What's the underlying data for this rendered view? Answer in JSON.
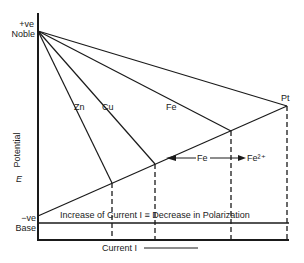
{
  "diagram": {
    "type": "evans-polarization-diagram",
    "y_axis": {
      "label": "Potential",
      "symbol": "E",
      "top_sign": "+ve",
      "top_label": "Noble",
      "bottom_sign": "−ve",
      "bottom_label": "Base"
    },
    "x_axis": {
      "label": "Current I",
      "arrow_direction": "right"
    },
    "anodic_lines": [
      {
        "label": "Zn"
      },
      {
        "label": "Cu"
      },
      {
        "label": "Fe"
      },
      {
        "label": "Pt"
      }
    ],
    "reaction": {
      "left": "Fe",
      "right": "Fe²⁺"
    },
    "annotation": "Increase of Current I ≡ Decrease in Polarization",
    "colors": {
      "line": "#1a1a1a",
      "background": "#ffffff"
    }
  }
}
